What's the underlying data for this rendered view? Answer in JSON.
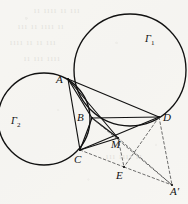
{
  "figure": {
    "kind": "euclidean-geometry-diagram",
    "background_color": "#f7f6f3",
    "stroke_color": "#111111",
    "dash_color": "#4a4a4a",
    "width": 188,
    "height": 204,
    "circles": [
      {
        "id": "gamma1",
        "label": "Γ",
        "subscript": "1",
        "cx": 130,
        "cy": 70,
        "r": 56,
        "label_x": 145,
        "label_y": 34
      },
      {
        "id": "gamma2",
        "label": "Γ",
        "subscript": "2",
        "cx": 44,
        "cy": 119,
        "r": 46,
        "label_x": 11,
        "label_y": 116
      }
    ],
    "points": [
      {
        "id": "A",
        "label": "A",
        "x": 68,
        "y": 79,
        "label_x": 56,
        "label_y": 74
      },
      {
        "id": "B",
        "label": "B",
        "x": 92,
        "y": 118,
        "label_x": 77,
        "label_y": 112
      },
      {
        "id": "C",
        "label": "C",
        "x": 80,
        "y": 150,
        "label_x": 74,
        "label_y": 154
      },
      {
        "id": "D",
        "label": "D",
        "x": 159,
        "y": 117,
        "label_x": 163,
        "label_y": 112
      },
      {
        "id": "M",
        "label": "M",
        "x": 118,
        "y": 138,
        "label_x": 111,
        "label_y": 139
      },
      {
        "id": "E",
        "label": "E",
        "x": 124,
        "y": 167,
        "label_x": 116,
        "label_y": 170
      },
      {
        "id": "Ap",
        "label": "A′",
        "x": 172,
        "y": 185,
        "label_x": 170,
        "label_y": 186
      }
    ],
    "solid_segments": [
      {
        "from": "A",
        "to": "B"
      },
      {
        "from": "A",
        "to": "C"
      },
      {
        "from": "A",
        "to": "D"
      },
      {
        "from": "A",
        "to": "M"
      },
      {
        "from": "B",
        "to": "C"
      },
      {
        "from": "B",
        "to": "D"
      },
      {
        "from": "C",
        "to": "D"
      },
      {
        "from": "C",
        "to": "M"
      },
      {
        "from": "B",
        "to": "M"
      }
    ],
    "dashed_segments": [
      {
        "from": "B",
        "to": "Ap"
      },
      {
        "from": "C",
        "to": "E"
      },
      {
        "from": "E",
        "to": "Ap"
      },
      {
        "from": "D",
        "to": "Ap"
      },
      {
        "from": "M",
        "to": "Ap"
      },
      {
        "from": "D",
        "to": "E"
      },
      {
        "from": "M",
        "to": "E"
      }
    ],
    "bleed_text_lines": [
      {
        "text": "ıı ıııı ıı ııı",
        "x": 34,
        "y": 6
      },
      {
        "text": "ııı ıı ıııı ıı",
        "x": 18,
        "y": 22
      },
      {
        "text": "ıııı ıı ıı ııı",
        "x": 10,
        "y": 38
      },
      {
        "text": "ıı ııı ıııı",
        "x": 24,
        "y": 54
      },
      {
        "text": "ııı ıııı ıı",
        "x": 106,
        "y": 152
      }
    ]
  }
}
